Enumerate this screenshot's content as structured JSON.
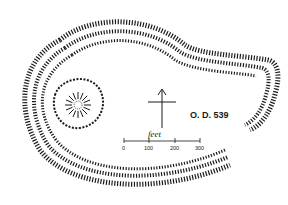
{
  "figure": {
    "type": "archaeological earthwork plan",
    "elevation_label": "O. D. 539",
    "scale_bar": {
      "unit_label": "feet",
      "ticks": [
        "0",
        "100",
        "200",
        "300"
      ]
    },
    "north_arrow": true,
    "features": [
      "triple rampart and ditch enclosure",
      "inner circular mound with radiating hachures"
    ],
    "colors": {
      "ink": "#1a1a1a",
      "paper": "#ffffff"
    }
  }
}
